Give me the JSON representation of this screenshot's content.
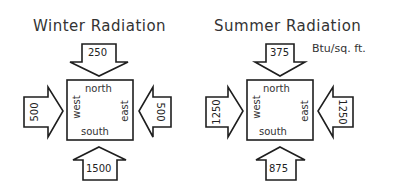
{
  "diagrams": [
    {
      "title": "Winter Radiation",
      "house": {
        "north": "north",
        "south": "south",
        "east": "east",
        "west": "west"
      },
      "values": {
        "north": "250",
        "south": "1500",
        "east": "500",
        "west": "500"
      }
    },
    {
      "title": "Summer Radiation",
      "units": "Btu/sq. ft.",
      "house": {
        "north": "north",
        "south": "south",
        "east": "east",
        "west": "west"
      },
      "values": {
        "north": "375",
        "south": "875",
        "east": "1250",
        "west": "1250"
      }
    }
  ],
  "colors": {
    "stroke": "#1e1e1e",
    "background": "#ffffff"
  }
}
